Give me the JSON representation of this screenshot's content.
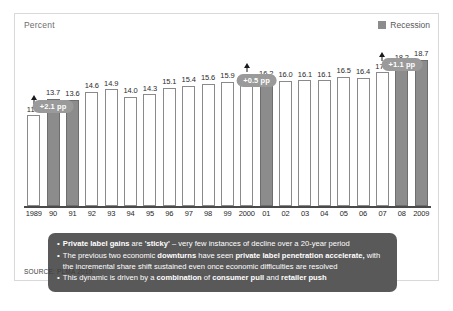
{
  "chart_frame": {
    "axis_title": "Percent",
    "legend": {
      "swatch_color": "#8c8c8c",
      "label": "Recession"
    },
    "source": "SOURCE: PLMA 2010"
  },
  "chart_data": {
    "type": "bar",
    "title": "",
    "subtitle": "",
    "xlabel": "",
    "ylabel": "Percent",
    "ylim": [
      0,
      20
    ],
    "grid": false,
    "legend_position": "top-right",
    "categories": [
      "1989",
      "90",
      "91",
      "92",
      "93",
      "94",
      "95",
      "96",
      "97",
      "98",
      "99",
      "2000",
      "01",
      "02",
      "03",
      "04",
      "05",
      "06",
      "07",
      "08",
      "2009"
    ],
    "values": [
      11.6,
      13.7,
      13.6,
      14.6,
      14.9,
      14.0,
      14.3,
      15.1,
      15.4,
      15.6,
      15.9,
      15.7,
      16.2,
      16.0,
      16.1,
      16.1,
      16.5,
      16.4,
      17.1,
      18.2,
      18.7
    ],
    "recession_flags": [
      false,
      true,
      true,
      false,
      false,
      false,
      false,
      false,
      false,
      false,
      false,
      false,
      true,
      false,
      false,
      false,
      false,
      false,
      false,
      true,
      true
    ],
    "arrow_markers": [
      {
        "category": "1989",
        "value": 11.6
      },
      {
        "category": "2000",
        "value": 15.7
      },
      {
        "category": "07",
        "value": 17.1
      }
    ],
    "annotations": [
      {
        "label": "+2.1 pp",
        "from_category": "1989",
        "to_category": "91"
      },
      {
        "label": "+0.5 pp",
        "from_category": "2000",
        "to_category": "01"
      },
      {
        "label": "+1.1 pp",
        "from_category": "07",
        "to_category": "2009"
      }
    ]
  },
  "callout": {
    "bullet_char": "•",
    "bullets": [
      [
        {
          "text": "Private label gains",
          "bold": true
        },
        {
          "text": " are ",
          "bold": false
        },
        {
          "text": "'sticky'",
          "bold": true
        },
        {
          "text": " – very few instances of decline over a 20-year period",
          "bold": false
        }
      ],
      [
        {
          "text": "The previous two economic ",
          "bold": false
        },
        {
          "text": "downturns",
          "bold": true
        },
        {
          "text": " have seen ",
          "bold": false
        },
        {
          "text": "private label penetration accelerate,",
          "bold": true
        },
        {
          "text": " with the incremental share shift sustained even once economic difficulties are resolved",
          "bold": false
        }
      ],
      [
        {
          "text": "This dynamic is driven by a ",
          "bold": false
        },
        {
          "text": "combination",
          "bold": true
        },
        {
          "text": " of ",
          "bold": false
        },
        {
          "text": "consumer pull",
          "bold": true
        },
        {
          "text": " and ",
          "bold": false
        },
        {
          "text": "retailer push",
          "bold": true
        }
      ]
    ]
  },
  "colors": {
    "recession_bar": "#8c8c8c",
    "normal_bar": "#ffffff",
    "bar_outline": "#8a8a8a",
    "callout_bg": "#595959",
    "pill_bg": "#9a9a9a",
    "baseline": "#4a4a4a"
  }
}
